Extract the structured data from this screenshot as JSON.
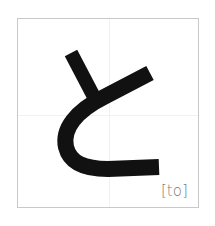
{
  "card": {
    "kana": "と",
    "romaji": "[to]",
    "stroke_color": "#111111",
    "border_color": "#c8c8c8",
    "guide_color": "#f1f1f1",
    "label_color": "#7a7a7a"
  }
}
